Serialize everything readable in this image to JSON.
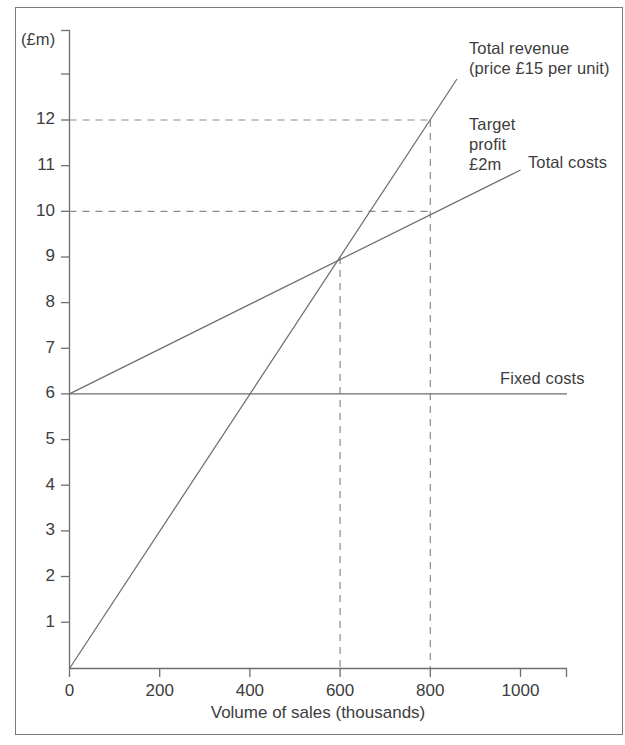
{
  "figure": {
    "unit_label": "(£m)",
    "x_axis_title": "Volume of sales (thousands)",
    "annotations": {
      "total_revenue": "Total revenue\n(price £15 per unit)",
      "target_profit": "Target\nprofit\n£2m",
      "total_costs": "Total costs",
      "fixed_costs": "Fixed costs"
    },
    "y_tick_labels": [
      "1",
      "2",
      "3",
      "4",
      "5",
      "6",
      "7",
      "8",
      "9",
      "10",
      "11",
      "12"
    ],
    "x_tick_labels": [
      "0",
      "200",
      "400",
      "600",
      "800",
      "1000"
    ],
    "colors": {
      "line": "#6e6e6e",
      "guide": "#8a8a8a",
      "text": "#3d3d3d",
      "frame": "#7b7b7b",
      "background": "#ffffff"
    }
  },
  "chart_data": {
    "type": "line",
    "title": "",
    "xlabel": "Volume of sales (thousands)",
    "ylabel": "(£m)",
    "xlim": [
      0,
      1110
    ],
    "ylim": [
      0,
      14
    ],
    "xticks": [
      0,
      200,
      400,
      600,
      800,
      1000
    ],
    "yticks": [
      1,
      2,
      3,
      4,
      5,
      6,
      7,
      8,
      9,
      10,
      11,
      12,
      13
    ],
    "ytick_labels_shown": [
      1,
      2,
      3,
      4,
      5,
      6,
      7,
      8,
      9,
      10,
      11,
      12
    ],
    "grid": false,
    "legend": "inline-annotations",
    "series": [
      {
        "name": "Total revenue (price £15 per unit)",
        "x": [
          0,
          860
        ],
        "y": [
          0,
          12.9
        ],
        "style": "solid"
      },
      {
        "name": "Total costs",
        "x": [
          0,
          1000
        ],
        "y": [
          6,
          10.9
        ],
        "style": "solid"
      },
      {
        "name": "Fixed costs",
        "x": [
          0,
          1110
        ],
        "y": [
          6,
          6
        ],
        "style": "solid"
      }
    ],
    "guides": [
      {
        "name": "break-even-vertical",
        "x": 600,
        "y_from": 0,
        "y_to": 9,
        "style": "dashed"
      },
      {
        "name": "target-vertical",
        "x": 800,
        "y_from": 0,
        "y_to": 12,
        "style": "dashed"
      },
      {
        "name": "revenue-12m-horizontal",
        "y": 12,
        "x_from": 0,
        "x_to": 800,
        "style": "dashed"
      },
      {
        "name": "cost-10m-horizontal",
        "y": 10,
        "x_from": 0,
        "x_to": 800,
        "style": "dashed"
      }
    ],
    "key_points": {
      "break_even_volume_thousands": 600,
      "break_even_value_m": 9,
      "target_volume_thousands": 800,
      "target_revenue_m": 12,
      "target_cost_m": 10,
      "target_profit_m": 2,
      "fixed_costs_m": 6,
      "price_per_unit_gbp": 15
    }
  }
}
